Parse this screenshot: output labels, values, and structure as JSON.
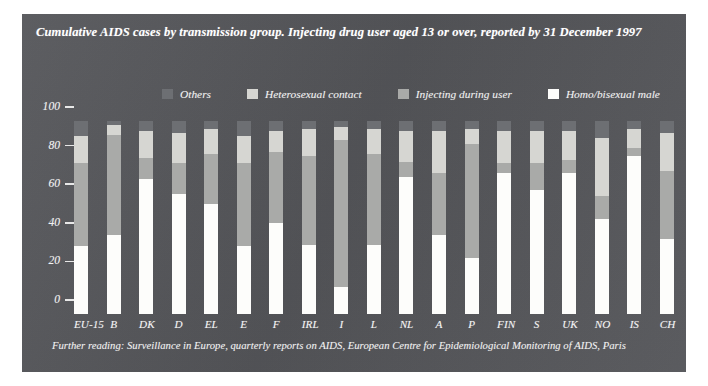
{
  "panel": {
    "background_color": "#55565a",
    "title": "Cumulative AIDS cases by transmission group. Injecting drug user aged 13 or over, reported by 31 December 1997",
    "footer": "Further reading: Surveillance in Europe, quarterly reports on AIDS, European Centre for Epidemiological Monitoring of AIDS, Paris"
  },
  "legend": {
    "position": "top-center",
    "items": [
      {
        "label": "Others",
        "color": "#6d6f73"
      },
      {
        "label": "Heterosexual contact",
        "color": "#d6d6d2"
      },
      {
        "label": "Injecting during user",
        "color": "#a9aaa8"
      },
      {
        "label": "Homo/bisexual male",
        "color": "#fdfdfb"
      }
    ]
  },
  "chart_data": {
    "type": "bar",
    "stacked": true,
    "title": "Cumulative AIDS cases by transmission group. Injecting drug user aged 13 or over, reported by 31 December 1997",
    "xlabel": "",
    "ylabel": "",
    "ylim": [
      0,
      100
    ],
    "yticks": [
      0,
      20,
      40,
      60,
      80,
      100
    ],
    "grid": false,
    "units": "percent",
    "categories": [
      "EU-15",
      "B",
      "DK",
      "D",
      "EL",
      "E",
      "F",
      "IRL",
      "I",
      "L",
      "NL",
      "A",
      "P",
      "FIN",
      "S",
      "UK",
      "NO",
      "IS",
      "CH"
    ],
    "series": [
      {
        "name": "Homo/bisexual male",
        "color": "#fdfdfb",
        "values": [
          35,
          41,
          70,
          62,
          57,
          35,
          47,
          36,
          14,
          36,
          71,
          41,
          29,
          73,
          64,
          73,
          49,
          82,
          39
        ]
      },
      {
        "name": "Injecting during user",
        "color": "#a9aaa8",
        "values": [
          43,
          52,
          11,
          16,
          26,
          43,
          37,
          46,
          76,
          47,
          8,
          32,
          59,
          5,
          14,
          7,
          12,
          4,
          35
        ]
      },
      {
        "name": "Heterosexual contact",
        "color": "#d6d6d2",
        "values": [
          14,
          5,
          14,
          16,
          13,
          14,
          11,
          14,
          7,
          13,
          16,
          22,
          8,
          17,
          17,
          15,
          30,
          10,
          20
        ]
      },
      {
        "name": "Others",
        "color": "#6d6f73",
        "values": [
          8,
          2,
          5,
          6,
          4,
          8,
          5,
          4,
          3,
          4,
          5,
          5,
          4,
          5,
          5,
          5,
          9,
          4,
          6
        ]
      }
    ]
  }
}
